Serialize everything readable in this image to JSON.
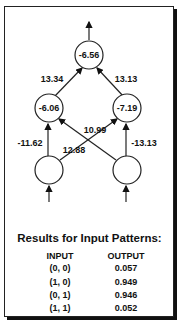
{
  "diagram": {
    "output_node": {
      "label": "-6.56"
    },
    "hidden_nodes": [
      {
        "label": "-6.06"
      },
      {
        "label": "-7.19"
      }
    ],
    "input_nodes": [
      {
        "label": ""
      },
      {
        "label": ""
      }
    ],
    "weights": {
      "h1_to_out": "13.34",
      "h2_to_out": "13.13",
      "in1_to_h1": "-11.62",
      "in2_to_h2": "-13.13",
      "in1_to_h2": "12.88",
      "in2_to_h1": "10.99"
    }
  },
  "results": {
    "title": "Results for Input Patterns:",
    "headers": {
      "input": "INPUT",
      "output": "OUTPUT"
    },
    "rows": [
      {
        "input": "(0, 0)",
        "output": "0.057"
      },
      {
        "input": "(1, 0)",
        "output": "0.949"
      },
      {
        "input": "(0, 1)",
        "output": "0.946"
      },
      {
        "input": "(1, 1)",
        "output": "0.052"
      }
    ]
  }
}
